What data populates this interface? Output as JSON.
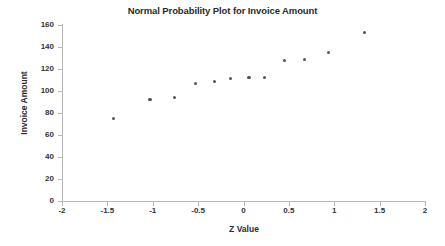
{
  "chart_data": {
    "type": "scatter",
    "title": "Normal Probability Plot for Invoice Amount",
    "xlabel": "Z Value",
    "ylabel": "Invoice Amount",
    "xlim": [
      -2,
      2
    ],
    "ylim": [
      0,
      160
    ],
    "xticks": [
      -2,
      -1.5,
      -1,
      -0.5,
      0,
      0.5,
      1,
      1.5,
      2
    ],
    "xtick_labels": [
      "-2",
      "-1.5",
      "-1",
      "-0.5",
      "0",
      "0.5",
      "1",
      "1.5",
      "2"
    ],
    "yticks": [
      0,
      20,
      40,
      60,
      80,
      100,
      120,
      140,
      160
    ],
    "ytick_labels": [
      "0",
      "20",
      "40",
      "60",
      "80",
      "100",
      "120",
      "140",
      "160"
    ],
    "grid": false,
    "legend": false,
    "marker_color": "#555555",
    "axis_color": "#b8b8b8",
    "series": [
      {
        "name": "Invoice Amount",
        "x": [
          -1.43,
          -1.03,
          -0.76,
          -0.53,
          -0.32,
          -0.14,
          0.06,
          0.23,
          0.45,
          0.67,
          0.94,
          1.33
        ],
        "y": [
          75,
          92,
          94,
          107,
          109,
          111,
          112,
          112,
          128,
          129,
          135,
          153
        ]
      }
    ]
  }
}
